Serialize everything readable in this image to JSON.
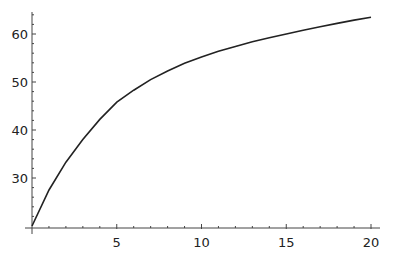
{
  "chart_data": {
    "type": "line",
    "title": "",
    "xlabel": "",
    "ylabel": "",
    "xlim": [
      0,
      20
    ],
    "ylim": [
      20,
      64
    ],
    "grid": false,
    "legend": null,
    "x_ticks": [
      5,
      10,
      15,
      20
    ],
    "y_ticks": [
      30,
      40,
      50,
      60
    ],
    "x_tick_labels": [
      "5",
      "10",
      "15",
      "20"
    ],
    "y_tick_labels": [
      "30",
      "40",
      "50",
      "60"
    ],
    "series": [
      {
        "name": "curve",
        "color": "#222222",
        "x": [
          0,
          1,
          2,
          3,
          4,
          5,
          6,
          7,
          8,
          9,
          10,
          11,
          12,
          13,
          14,
          15,
          16,
          17,
          18,
          19,
          20
        ],
        "y": [
          20,
          27.5,
          33.3,
          38.0,
          42.2,
          45.8,
          48.3,
          50.5,
          52.3,
          53.9,
          55.2,
          56.4,
          57.4,
          58.4,
          59.2,
          60.0,
          60.8,
          61.5,
          62.2,
          62.9,
          63.5
        ]
      }
    ]
  }
}
